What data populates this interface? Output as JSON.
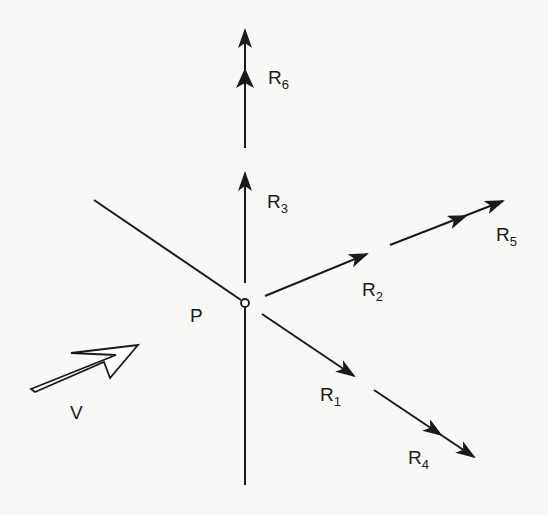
{
  "diagram": {
    "point": {
      "label": "P",
      "x": 245,
      "y": 303
    },
    "incident": {
      "label": "V"
    },
    "rays": [
      {
        "id": "R1",
        "base": "R",
        "sub": "1"
      },
      {
        "id": "R2",
        "base": "R",
        "sub": "2"
      },
      {
        "id": "R3",
        "base": "R",
        "sub": "3"
      },
      {
        "id": "R4",
        "base": "R",
        "sub": "4"
      },
      {
        "id": "R5",
        "base": "R",
        "sub": "5"
      },
      {
        "id": "R6",
        "base": "R",
        "sub": "6"
      }
    ],
    "colors": {
      "ink": "#1a1a1a",
      "background": "#f8f8f6"
    }
  }
}
